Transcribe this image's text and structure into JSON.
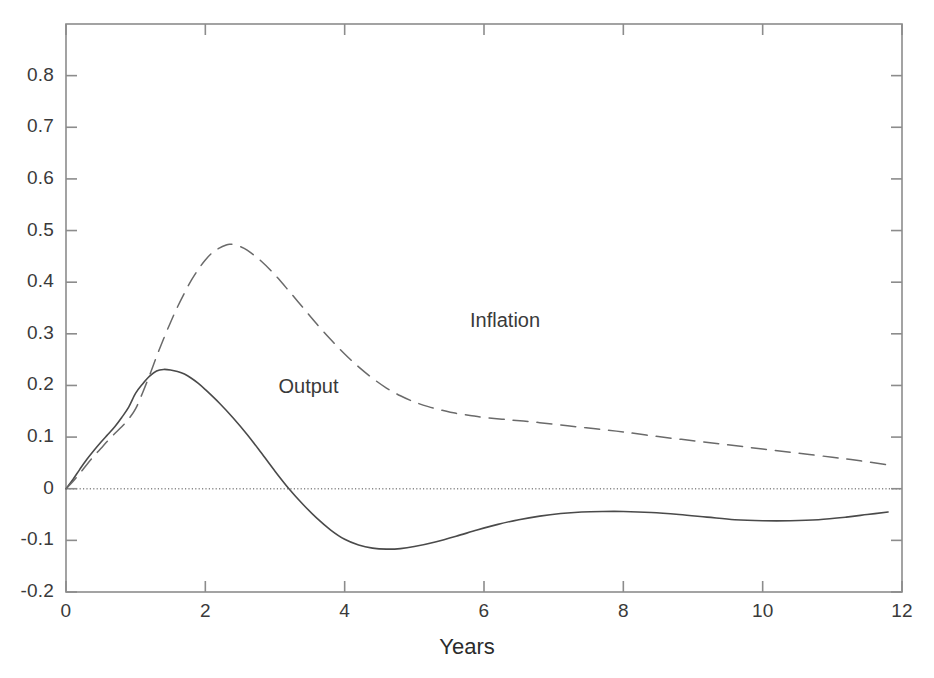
{
  "chart_data": {
    "type": "line",
    "title": "",
    "subtitle": "",
    "xlabel": "Years",
    "ylabel": "",
    "xlim": [
      0,
      12
    ],
    "ylim": [
      -0.2,
      0.9
    ],
    "xticks": [
      0,
      2,
      4,
      6,
      8,
      10,
      12
    ],
    "xticklabels": [
      "0",
      "2",
      "4",
      "6",
      "8",
      "10",
      "12"
    ],
    "yticks": [
      -0.2,
      -0.1,
      0,
      0.1,
      0.2,
      0.3,
      0.4,
      0.5,
      0.6,
      0.7,
      0.8
    ],
    "yticklabels": [
      "-0.2",
      "-0.1",
      "0",
      "0.1",
      "0.2",
      "0.3",
      "0.4",
      "0.5",
      "0.6",
      "0.7",
      "0.8"
    ],
    "grid": false,
    "legend_position": "inline-annotations",
    "zero_line": {
      "value": 0,
      "style": "dotted",
      "color": "#8a8a8a"
    },
    "annotations": [
      {
        "text": "Output",
        "x": 3.05,
        "y": 0.197,
        "series": "Output"
      },
      {
        "text": "Inflation",
        "x": 5.8,
        "y": 0.325,
        "series": "Inflation"
      }
    ],
    "series": [
      {
        "name": "Output",
        "style": "solid",
        "color": "#4a4a4a",
        "x": [
          0.0,
          0.1,
          0.2,
          0.3,
          0.4,
          0.5,
          0.6,
          0.7,
          0.8,
          0.9,
          1.0,
          1.1,
          1.2,
          1.3,
          1.4,
          1.5,
          1.6,
          1.7,
          1.8,
          1.9,
          2.0,
          2.2,
          2.4,
          2.6,
          2.8,
          3.0,
          3.2,
          3.4,
          3.6,
          3.8,
          4.0,
          4.2,
          4.4,
          4.6,
          4.8,
          5.0,
          5.3,
          5.6,
          5.9,
          6.2,
          6.5,
          6.8,
          7.1,
          7.4,
          7.7,
          8.0,
          8.4,
          8.8,
          9.2,
          9.6,
          10.0,
          10.4,
          10.8,
          11.2,
          11.5,
          11.8
        ],
        "y": [
          0.0,
          0.018,
          0.038,
          0.057,
          0.074,
          0.09,
          0.105,
          0.12,
          0.138,
          0.158,
          0.185,
          0.203,
          0.218,
          0.228,
          0.231,
          0.23,
          0.227,
          0.222,
          0.214,
          0.204,
          0.192,
          0.166,
          0.137,
          0.105,
          0.07,
          0.034,
          0.0,
          -0.03,
          -0.057,
          -0.08,
          -0.098,
          -0.109,
          -0.115,
          -0.117,
          -0.116,
          -0.112,
          -0.103,
          -0.092,
          -0.08,
          -0.069,
          -0.06,
          -0.053,
          -0.048,
          -0.045,
          -0.044,
          -0.044,
          -0.046,
          -0.05,
          -0.055,
          -0.06,
          -0.062,
          -0.062,
          -0.06,
          -0.055,
          -0.05,
          -0.045
        ]
      },
      {
        "name": "Inflation",
        "style": "dashed",
        "color": "#6a6a6a",
        "x": [
          0.0,
          0.1,
          0.2,
          0.3,
          0.4,
          0.5,
          0.6,
          0.7,
          0.8,
          0.9,
          1.0,
          1.1,
          1.2,
          1.3,
          1.4,
          1.5,
          1.6,
          1.7,
          1.8,
          1.9,
          2.0,
          2.1,
          2.2,
          2.3,
          2.35,
          2.4,
          2.5,
          2.6,
          2.8,
          3.0,
          3.2,
          3.4,
          3.6,
          3.8,
          4.0,
          4.2,
          4.4,
          4.6,
          4.8,
          5.0,
          5.2,
          5.4,
          5.6,
          5.8,
          6.0,
          6.4,
          6.8,
          7.2,
          7.6,
          8.0,
          8.5,
          9.0,
          9.5,
          10.0,
          10.5,
          11.0,
          11.4,
          11.8
        ],
        "y": [
          0.0,
          0.014,
          0.03,
          0.047,
          0.063,
          0.078,
          0.093,
          0.107,
          0.12,
          0.135,
          0.155,
          0.186,
          0.22,
          0.256,
          0.29,
          0.322,
          0.352,
          0.379,
          0.404,
          0.425,
          0.443,
          0.457,
          0.466,
          0.472,
          0.4735,
          0.473,
          0.469,
          0.462,
          0.441,
          0.414,
          0.383,
          0.351,
          0.319,
          0.289,
          0.261,
          0.236,
          0.214,
          0.195,
          0.18,
          0.168,
          0.159,
          0.152,
          0.146,
          0.142,
          0.138,
          0.133,
          0.128,
          0.122,
          0.116,
          0.11,
          0.101,
          0.093,
          0.085,
          0.077,
          0.069,
          0.061,
          0.054,
          0.046
        ]
      }
    ]
  },
  "axes": {
    "x_tick_labels": [
      "0",
      "2",
      "4",
      "6",
      "8",
      "10",
      "12"
    ],
    "y_tick_labels": [
      "0.8",
      "0.7",
      "0.6",
      "0.5",
      "0.4",
      "0.3",
      "0.2",
      "0.1",
      "0",
      "-0.1",
      "-0.2"
    ],
    "x_axis_title": "Years"
  },
  "labels": {
    "output": "Output",
    "inflation": "Inflation"
  },
  "colors": {
    "axis": "#8c8c8c",
    "output_line": "#4a4a4a",
    "inflation_line": "#6a6a6a",
    "zero_line": "#9a9a9a",
    "text": "#2b2b2b",
    "background": "#ffffff"
  }
}
